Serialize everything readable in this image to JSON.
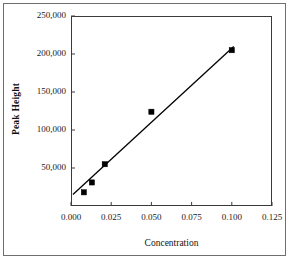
{
  "chart_data": {
    "type": "scatter",
    "title": "",
    "xlabel": "Concentration",
    "ylabel": "Peak Height",
    "xlim": [
      0.0,
      0.125
    ],
    "ylim": [
      0,
      250000
    ],
    "grid": false,
    "legend": null,
    "x_ticks": [
      "0.000",
      "0.025",
      "0.050",
      "0.075",
      "0.100",
      "0.125"
    ],
    "x_tick_values": [
      0.0,
      0.025,
      0.05,
      0.075,
      0.1,
      0.125
    ],
    "y_ticks": [
      "50,000",
      "100,000",
      "150,000",
      "200,000",
      "250,000"
    ],
    "y_tick_values": [
      50000,
      100000,
      150000,
      200000,
      250000
    ],
    "marker": "square",
    "marker_color": "#000000",
    "line_color": "#000000",
    "series": [
      {
        "name": "Calibration points",
        "x": [
          0.008,
          0.013,
          0.021,
          0.05,
          0.1
        ],
        "values": [
          18000,
          31000,
          55000,
          124000,
          205000
        ]
      },
      {
        "name": "Best fit line",
        "type": "line",
        "x": [
          0.0012,
          0.1012
        ],
        "values": [
          15000,
          210000
        ]
      }
    ]
  },
  "axis": {
    "x_title": "Concentration",
    "y_title": "Peak Height"
  },
  "ticks": {
    "y": [
      {
        "label": "250,000",
        "value": 250000
      },
      {
        "label": "200,000",
        "value": 200000
      },
      {
        "label": "150,000",
        "value": 150000
      },
      {
        "label": "100,000",
        "value": 100000
      },
      {
        "label": "50,000",
        "value": 50000
      }
    ],
    "x": [
      {
        "label": "0.000",
        "value": 0.0
      },
      {
        "label": "0.025",
        "value": 0.025
      },
      {
        "label": "0.050",
        "value": 0.05
      },
      {
        "label": "0.075",
        "value": 0.075
      },
      {
        "label": "0.100",
        "value": 0.1
      },
      {
        "label": "0.125",
        "value": 0.125
      }
    ]
  }
}
